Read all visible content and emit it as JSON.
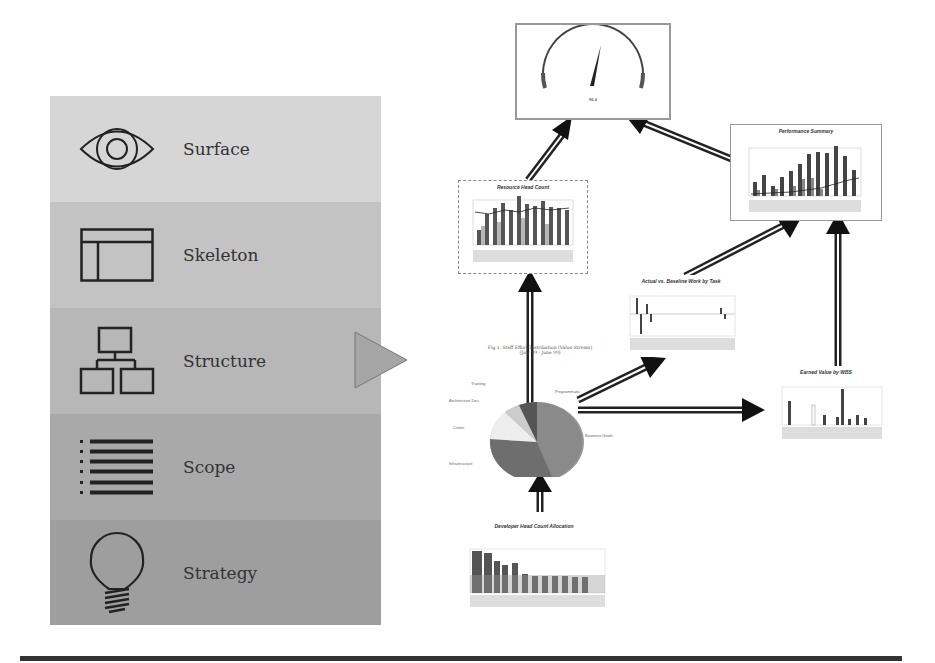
{
  "layers": [
    {
      "label": "Surface",
      "icon": "eye-icon",
      "color": "#d6d6d6"
    },
    {
      "label": "Skeleton",
      "icon": "layout-icon",
      "color": "#c3c3c3"
    },
    {
      "label": "Structure",
      "icon": "hierarchy-icon",
      "color": "#b7b7b7"
    },
    {
      "label": "Scope",
      "icon": "list-icon",
      "color": "#a9a9a9"
    },
    {
      "label": "Strategy",
      "icon": "lightbulb-icon",
      "color": "#9e9e9e"
    }
  ],
  "pointer": {
    "icon": "triangle-pointer-icon",
    "target_layer": "Structure"
  },
  "charts": {
    "gauge": {
      "title": "Gauge",
      "value": "96.4"
    },
    "resource_head_count": {
      "title": "Resource Head Count"
    },
    "performance_summary": {
      "title": "Performance Summary"
    },
    "actual_vs_baseline": {
      "title": "Actual vs. Baseline Work by Task"
    },
    "staff_effort_pie": {
      "title": "Fig 1.  Staff Effort Distribution (Value Stream)",
      "subtitle": "(July 99 - June 99)",
      "slices": [
        "Training",
        "Architecture Dev.",
        "Crises",
        "Infrastructure",
        "Programmatic",
        "Business Goals"
      ]
    },
    "earned_value": {
      "title": "Earned Value by WBS"
    },
    "developer_head_count": {
      "title": "Developer Head Count Allocation"
    }
  }
}
